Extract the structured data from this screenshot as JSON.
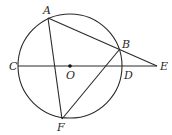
{
  "diagram": {
    "circle": {
      "center": "O",
      "cx": 70,
      "cy": 66,
      "r": 52
    },
    "points": {
      "A": {
        "label": "A",
        "x": 48,
        "y": 18,
        "lx": 43,
        "ly": 14
      },
      "B": {
        "label": "B",
        "x": 119,
        "y": 50,
        "lx": 122,
        "ly": 48
      },
      "C": {
        "label": "C",
        "x": 18,
        "y": 66,
        "lx": 9,
        "ly": 70
      },
      "D": {
        "label": "D",
        "x": 122,
        "y": 66,
        "lx": 124,
        "ly": 79
      },
      "E": {
        "label": "E",
        "x": 157,
        "y": 66,
        "lx": 160,
        "ly": 70
      },
      "F": {
        "label": "F",
        "x": 62,
        "y": 119,
        "lx": 57,
        "ly": 131
      },
      "O": {
        "label": "O",
        "x": 70,
        "y": 66,
        "lx": 66,
        "ly": 79
      }
    },
    "segments": [
      {
        "from": "A",
        "to": "E"
      },
      {
        "from": "C",
        "to": "E"
      },
      {
        "from": "A",
        "to": "F"
      },
      {
        "from": "F",
        "to": "B"
      }
    ],
    "colors": {
      "stroke": "#2a2a2a",
      "background": "#ffffff"
    }
  }
}
